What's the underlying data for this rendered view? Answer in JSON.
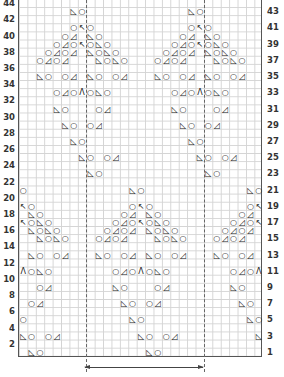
{
  "chart_data": {
    "type": "knitting-lace-chart",
    "columns": 29,
    "rows": 44,
    "left_labels": [
      "2",
      "4",
      "6",
      "8",
      "10",
      "12",
      "14",
      "16",
      "18",
      "20",
      "22",
      "24",
      "26",
      "28",
      "30",
      "32",
      "34",
      "36",
      "38",
      "40",
      "42",
      "44"
    ],
    "right_labels": [
      "1",
      "3",
      "5",
      "7",
      "9",
      "11",
      "13",
      "15",
      "17",
      "19",
      "21",
      "23",
      "25",
      "27",
      "29",
      "31",
      "33",
      "35",
      "37",
      "39",
      "41",
      "43"
    ],
    "symbols": {
      "yo": "○",
      "ssk": "◺",
      "k2tog": "◿",
      "sk2p": "↖",
      "cdd": "Λ"
    },
    "repeat_markers": {
      "left_col_boundary": 8,
      "right_col_boundary": 22,
      "arrow": "repeat"
    },
    "motif": [
      {
        "row": 43,
        "cells": [
          [
            7,
            "ssk"
          ],
          [
            8,
            "yo"
          ]
        ]
      },
      {
        "row": 41,
        "cells": [
          [
            7,
            "yo"
          ],
          [
            8,
            "sk2p"
          ],
          [
            9,
            "yo"
          ]
        ]
      },
      {
        "row": 40,
        "cells": [
          [
            6,
            "yo"
          ],
          [
            7,
            "k2tog"
          ],
          [
            9,
            "ssk"
          ],
          [
            10,
            "yo"
          ]
        ]
      },
      {
        "row": 39,
        "cells": [
          [
            5,
            "yo"
          ],
          [
            6,
            "k2tog"
          ],
          [
            7,
            "yo"
          ],
          [
            8,
            "sk2p"
          ],
          [
            9,
            "yo"
          ],
          [
            10,
            "ssk"
          ],
          [
            11,
            "yo"
          ]
        ]
      },
      {
        "row": 38,
        "cells": [
          [
            4,
            "yo"
          ],
          [
            5,
            "k2tog"
          ],
          [
            6,
            "yo"
          ],
          [
            7,
            "k2tog"
          ],
          [
            9,
            "ssk"
          ],
          [
            10,
            "yo"
          ],
          [
            11,
            "ssk"
          ],
          [
            12,
            "yo"
          ]
        ]
      },
      {
        "row": 37,
        "cells": [
          [
            3,
            "yo"
          ],
          [
            4,
            "k2tog"
          ],
          [
            5,
            "yo"
          ],
          [
            6,
            "k2tog"
          ],
          [
            10,
            "ssk"
          ],
          [
            11,
            "yo"
          ],
          [
            12,
            "ssk"
          ],
          [
            13,
            "yo"
          ]
        ]
      },
      {
        "row": 35,
        "cells": [
          [
            3,
            "ssk"
          ],
          [
            4,
            "yo"
          ],
          [
            6,
            "yo"
          ],
          [
            7,
            "k2tog"
          ],
          [
            9,
            "ssk"
          ],
          [
            10,
            "yo"
          ],
          [
            12,
            "yo"
          ],
          [
            13,
            "k2tog"
          ]
        ]
      },
      {
        "row": 33,
        "cells": [
          [
            5,
            "yo"
          ],
          [
            6,
            "k2tog"
          ],
          [
            7,
            "yo"
          ],
          [
            8,
            "cdd"
          ],
          [
            9,
            "yo"
          ],
          [
            10,
            "ssk"
          ],
          [
            11,
            "yo"
          ]
        ]
      },
      {
        "row": 31,
        "cells": [
          [
            5,
            "ssk"
          ],
          [
            6,
            "yo"
          ],
          [
            10,
            "yo"
          ],
          [
            11,
            "k2tog"
          ]
        ]
      },
      {
        "row": 29,
        "cells": [
          [
            6,
            "ssk"
          ],
          [
            7,
            "yo"
          ],
          [
            9,
            "yo"
          ],
          [
            10,
            "k2tog"
          ]
        ]
      },
      {
        "row": 27,
        "cells": [
          [
            7,
            "ssk"
          ],
          [
            8,
            "yo"
          ]
        ]
      },
      {
        "row": 25,
        "cells": [
          [
            8,
            "ssk"
          ],
          [
            9,
            "yo"
          ],
          [
            11,
            "yo"
          ],
          [
            12,
            "k2tog"
          ]
        ]
      },
      {
        "row": 23,
        "cells": [
          [
            9,
            "ssk"
          ],
          [
            10,
            "yo"
          ]
        ]
      }
    ],
    "placements": [
      {
        "col_offset": 0,
        "row_offset": 0
      },
      {
        "col_offset": 14,
        "row_offset": 0
      },
      {
        "col_offset": -7,
        "row_offset": -22
      },
      {
        "col_offset": 7,
        "row_offset": -22
      },
      {
        "col_offset": 21,
        "row_offset": -22
      }
    ]
  }
}
